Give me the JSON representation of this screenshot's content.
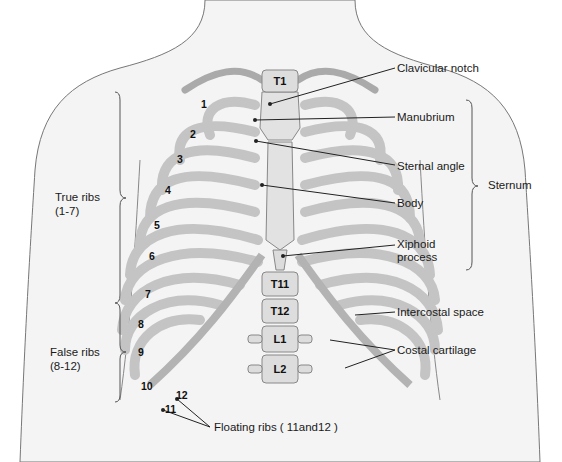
{
  "diagram": {
    "colors": {
      "bone": "#e6e6e6",
      "bone_shade": "#bdbdbd",
      "cartilage": "#c9c9c9",
      "skin": "#f3f3f3",
      "outline": "#6b6b6b",
      "leader": "#222222"
    },
    "right_labels": {
      "clavicular_notch": "Clavicular notch",
      "manubrium": "Manubrium",
      "sternal_angle": "Sternal angle",
      "body": "Body",
      "xiphoid_line1": "Xiphoid",
      "xiphoid_line2": "process",
      "sternum": "Sternum",
      "intercostal_space": "Intercostal space",
      "costal_cartilage": "Costal cartilage"
    },
    "left_labels": {
      "true_ribs_line1": "True ribs",
      "true_ribs_line2": "(1-7)",
      "false_ribs_line1": "False ribs",
      "false_ribs_line2": "(8-12)"
    },
    "bottom_label": "Floating ribs ( 11and12 )",
    "rib_numbers": [
      "1",
      "2",
      "3",
      "4",
      "5",
      "6",
      "7",
      "8",
      "9",
      "10",
      "11",
      "12"
    ],
    "vertebrae": [
      "T1",
      "T11",
      "T12",
      "L1",
      "L2"
    ]
  }
}
